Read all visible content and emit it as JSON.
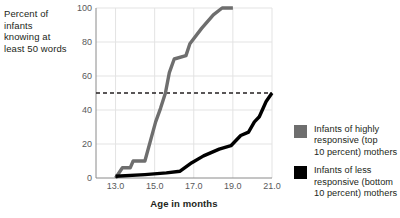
{
  "chart_data": {
    "type": "line",
    "title": "",
    "xlabel": "Age in months",
    "ylabel": "Percent of infants knowing at least 50 words",
    "ylabel_lines": [
      "Percent of",
      "infants",
      "knowing at",
      "least 50 words"
    ],
    "xlim": [
      12.0,
      21.0
    ],
    "ylim": [
      0,
      100
    ],
    "xticks": [
      13.0,
      15.0,
      17.0,
      19.0,
      21.0
    ],
    "xtick_labels": [
      "13.0",
      "15.0",
      "17.0",
      "19.0",
      "21.0"
    ],
    "yticks": [
      0,
      20,
      40,
      60,
      80,
      100
    ],
    "ytick_labels": [
      "0",
      "20",
      "40",
      "60",
      "80",
      "100"
    ],
    "grid": true,
    "grid_color": "#e3e3e3",
    "legend_position": "right",
    "reference_line": {
      "value": 50,
      "style": "dashed",
      "color": "#231f20",
      "label": ""
    },
    "series": [
      {
        "name": "Infants of highly responsive (top 10 percent) mothers",
        "legend_lines": [
          "Infants of highly",
          "responsive (top",
          "10 percent) mothers"
        ],
        "color": "#6e6e6e",
        "points": [
          [
            13.0,
            0
          ],
          [
            13.35,
            6
          ],
          [
            13.75,
            6
          ],
          [
            13.9,
            10
          ],
          [
            14.5,
            10
          ],
          [
            15.05,
            33
          ],
          [
            15.3,
            41
          ],
          [
            15.55,
            50
          ],
          [
            15.75,
            62
          ],
          [
            16.0,
            70
          ],
          [
            16.6,
            72
          ],
          [
            16.8,
            79
          ],
          [
            17.4,
            88
          ],
          [
            18.0,
            96
          ],
          [
            18.45,
            100
          ],
          [
            19.0,
            100
          ]
        ]
      },
      {
        "name": "Infants of less responsive (bottom 10 percent) mothers",
        "legend_lines": [
          "Infants of less",
          "responsive (bottom",
          "10 percent) mothers"
        ],
        "color": "#000000",
        "points": [
          [
            13.0,
            1
          ],
          [
            14.5,
            2
          ],
          [
            15.6,
            3
          ],
          [
            16.3,
            4
          ],
          [
            16.9,
            9
          ],
          [
            17.5,
            13
          ],
          [
            18.3,
            17
          ],
          [
            18.9,
            19
          ],
          [
            19.4,
            25
          ],
          [
            19.8,
            27
          ],
          [
            20.1,
            33
          ],
          [
            20.35,
            36
          ],
          [
            20.7,
            45
          ],
          [
            21.0,
            50
          ]
        ]
      }
    ]
  }
}
